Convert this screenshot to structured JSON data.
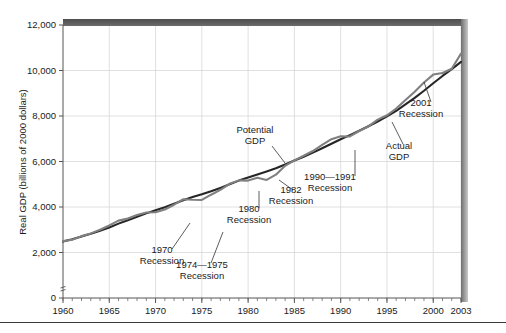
{
  "chart_data": {
    "type": "line",
    "title": "",
    "xlabel": "",
    "ylabel": "Real GDP (billions of 2000 dollars)",
    "xlim": [
      1960,
      2003
    ],
    "ylim": [
      0,
      12000
    ],
    "grid": true,
    "legend_position": "inline-annotations",
    "y_ticks": [
      0,
      2000,
      4000,
      6000,
      8000,
      10000,
      12000
    ],
    "y_tick_labels": [
      "0",
      "2,000",
      "4,000",
      "6,000",
      "8,000",
      "10,000",
      "12,000"
    ],
    "x_ticks": [
      1960,
      1965,
      1970,
      1975,
      1980,
      1985,
      1990,
      1995,
      2000,
      2003
    ],
    "x_tick_labels": [
      "1960",
      "1965",
      "1970",
      "1975",
      "1980",
      "1985",
      "1990",
      "1995",
      "2000",
      "2003"
    ],
    "x_minor_tick_interval": 1,
    "axis_break": true,
    "x": [
      1960,
      1961,
      1962,
      1963,
      1964,
      1965,
      1966,
      1967,
      1968,
      1969,
      1970,
      1971,
      1972,
      1973,
      1974,
      1975,
      1976,
      1977,
      1978,
      1979,
      1980,
      1981,
      1982,
      1983,
      1984,
      1985,
      1986,
      1987,
      1988,
      1989,
      1990,
      1991,
      1992,
      1993,
      1994,
      1995,
      1996,
      1997,
      1998,
      1999,
      2000,
      2001,
      2002,
      2003
    ],
    "series": [
      {
        "name": "Potential GDP",
        "color": "#262626",
        "values": [
          2480,
          2580,
          2700,
          2820,
          2960,
          3100,
          3270,
          3420,
          3570,
          3720,
          3860,
          3990,
          4140,
          4300,
          4440,
          4560,
          4690,
          4840,
          5000,
          5160,
          5300,
          5430,
          5560,
          5700,
          5870,
          6040,
          6210,
          6390,
          6580,
          6780,
          6980,
          7160,
          7350,
          7550,
          7760,
          7980,
          8230,
          8510,
          8800,
          9110,
          9440,
          9760,
          10060,
          10380
        ]
      },
      {
        "name": "Actual GDP",
        "color": "#808080",
        "values": [
          2500,
          2560,
          2720,
          2840,
          3000,
          3190,
          3400,
          3490,
          3650,
          3760,
          3770,
          3890,
          4100,
          4340,
          4320,
          4310,
          4540,
          4750,
          5020,
          5170,
          5160,
          5290,
          5190,
          5420,
          5810,
          6050,
          6250,
          6460,
          6730,
          6980,
          7110,
          7100,
          7340,
          7540,
          7840,
          8030,
          8330,
          8700,
          9070,
          9470,
          9820,
          9890,
          10080,
          10740
        ]
      }
    ],
    "annotations": [
      {
        "id": "recession-1970",
        "lines": [
          "1970",
          "Recession"
        ],
        "label_x": 162,
        "label_y": 253,
        "leader": [
          [
            172,
            249
          ],
          [
            190,
            223
          ]
        ]
      },
      {
        "id": "recession-1974-1975",
        "lines": [
          "1974—1975",
          "Recession"
        ],
        "label_x": 202,
        "label_y": 268,
        "leader": [
          [
            211,
            263
          ],
          [
            223,
            232
          ]
        ]
      },
      {
        "id": "recession-1980",
        "lines": [
          "1980",
          "Recession"
        ],
        "label_x": 249,
        "label_y": 212,
        "leader": [
          [
            259,
            208
          ],
          [
            259,
            191
          ]
        ]
      },
      {
        "id": "recession-1982",
        "lines": [
          "1982",
          "Recession"
        ],
        "label_x": 291,
        "label_y": 193,
        "leader": [
          [
            293,
            190
          ],
          [
            279,
            180
          ]
        ]
      },
      {
        "id": "potential-gdp",
        "lines": [
          "Potential",
          "GDP"
        ],
        "label_x": 255,
        "label_y": 133,
        "leader": [
          [
            272,
            146
          ],
          [
            285,
            163
          ]
        ]
      },
      {
        "id": "recession-1990-1991",
        "lines": [
          "1990—1991",
          "Recession"
        ],
        "label_x": 330,
        "label_y": 180,
        "leader": [
          [
            355,
            176
          ],
          [
            355,
            150
          ]
        ]
      },
      {
        "id": "actual-gdp",
        "lines": [
          "Actual",
          "GDP"
        ],
        "label_x": 399,
        "label_y": 149,
        "leader": [
          [
            403,
            144
          ],
          [
            392,
            122
          ]
        ]
      },
      {
        "id": "recession-2001",
        "lines": [
          "2001",
          "Recession"
        ],
        "label_x": 421,
        "label_y": 106,
        "leader": [
          [
            431,
            102
          ],
          [
            424,
            82
          ]
        ]
      }
    ]
  }
}
